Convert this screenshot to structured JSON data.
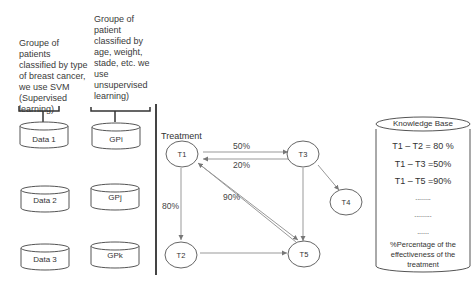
{
  "left": {
    "supervised_desc": [
      "Groupe of",
      "patients",
      "classified by type",
      "of breast cancer,",
      "we use SVM",
      "(Supervised",
      "learning)"
    ],
    "unsupervised_desc": [
      "Groupe of",
      "patient",
      "classified by",
      "age, weight,",
      "stade, etc. we",
      "use",
      "unsupervised",
      "learning)"
    ],
    "data_cylinders": [
      "Data 1",
      "Data 2",
      "Data 3"
    ],
    "group_cylinders": [
      "GPi",
      "GPj",
      "GPk"
    ]
  },
  "graph": {
    "title": "Treatment",
    "nodes": [
      {
        "id": "T1",
        "label": "T1"
      },
      {
        "id": "T2",
        "label": "T2"
      },
      {
        "id": "T3",
        "label": "T3"
      },
      {
        "id": "T4",
        "label": "T4"
      },
      {
        "id": "T5",
        "label": "T5"
      }
    ],
    "edges": [
      {
        "from": "T1",
        "to": "T3",
        "label": "50%"
      },
      {
        "from": "T3",
        "to": "T1",
        "label": "20%"
      },
      {
        "from": "T1",
        "to": "T2",
        "label": "80%"
      },
      {
        "from": "T1",
        "to": "T5",
        "label": "90%"
      },
      {
        "from": "T5",
        "to": "T1",
        "label": ""
      },
      {
        "from": "T3",
        "to": "T5",
        "label": ""
      },
      {
        "from": "T3",
        "to": "T4",
        "label": ""
      },
      {
        "from": "T2",
        "to": "T5",
        "label": ""
      }
    ],
    "edge_labels": {
      "t1_t3": "50%",
      "t3_t1": "20%",
      "t1_t2": "80%",
      "t1_t5": "90%"
    }
  },
  "knowledge_base": {
    "title": "Knowledge Base",
    "entries": [
      "T1 – T2 = 80 %",
      "T1 – T3 =50%",
      "T1 – T5 =90%",
      "........",
      ".........",
      "......"
    ],
    "footer": [
      "%Percentage of the",
      "effectiveness of the",
      "treatment"
    ]
  }
}
